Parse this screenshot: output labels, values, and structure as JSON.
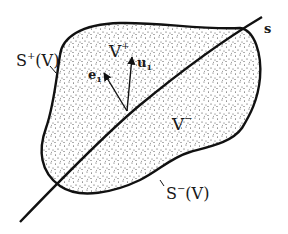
{
  "diagram": {
    "region": {
      "fill_style": "stippled",
      "outline_color": "#111111",
      "dot_color": "#2a2a2a"
    },
    "surface_line": {
      "label": "s"
    },
    "labels": {
      "v_plus": "V",
      "v_plus_sup": "+",
      "v_minus": "V",
      "v_minus_sup": "−",
      "s_plus": "S",
      "s_plus_sup": "+",
      "s_plus_arg": "(V)",
      "s_minus": "S",
      "s_minus_sup": "−",
      "s_minus_arg": "(V)",
      "e1": "e",
      "e1_sub": "1",
      "u1": "u",
      "u1_sub": "1"
    }
  }
}
